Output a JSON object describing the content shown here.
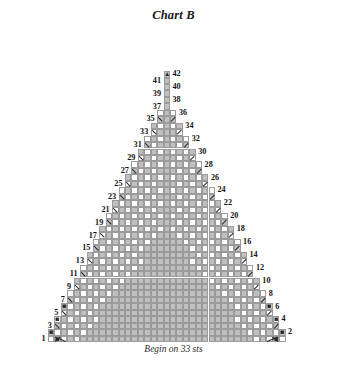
{
  "chart": {
    "title": "Chart B",
    "caption": "Begin on 33 sts",
    "begin_sts": 33,
    "total_rows": 42,
    "total_columns": 37,
    "colors": {
      "filled_cell": "#bfbfbf",
      "empty_cell": "#ffffff",
      "grid_line": "#9b9b9b",
      "symbol": "#2a2a2a",
      "text": "#141414",
      "background": "#ffffff"
    },
    "geometry": {
      "cell_w": 6.42,
      "cell_h": 6.45,
      "origin_x": 48,
      "origin_y": 30,
      "bottom_y": 342
    },
    "row_numbers": {
      "odd_side": "left",
      "even_side": "right",
      "odd": [
        1,
        3,
        5,
        7,
        9,
        11,
        13,
        15,
        17,
        19,
        21,
        23,
        25,
        27,
        29,
        31,
        33,
        35,
        37,
        39,
        41
      ],
      "even": [
        2,
        4,
        6,
        8,
        10,
        12,
        14,
        16,
        18,
        20,
        22,
        24,
        26,
        28,
        30,
        32,
        34,
        36,
        38,
        40,
        42
      ]
    },
    "legend_symbols": {
      "apex": "▲",
      "left_decrease": "\\",
      "right_decrease": "/",
      "bobble": "■",
      "double_decrease": "╱╲"
    },
    "structure_note": "Triangular shawl chart: widest at row 1 (33 sts cast on), tapering to a single apex cell at row 42. Rows are worked bottom to top; odd rows read right-to-left, even rows left-to-right."
  }
}
